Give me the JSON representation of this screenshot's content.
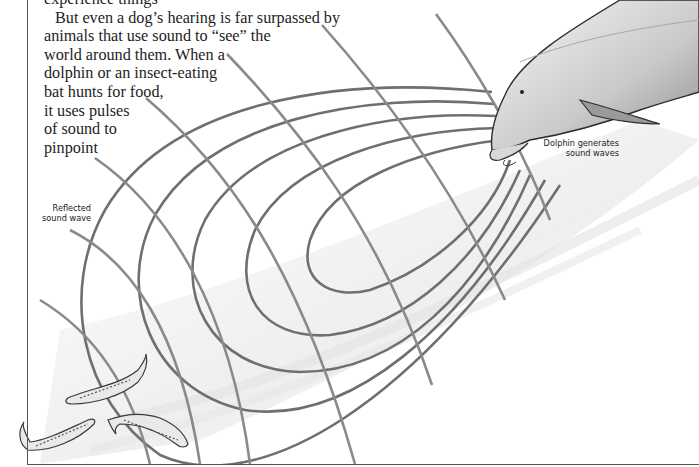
{
  "page": {
    "body_text": {
      "cut_off_line": "experience things",
      "lines": [
        "But even a dog’s hearing is far surpassed by",
        "animals that use sound to “see” the",
        "world around them. When a",
        "dolphin or an insect-eating",
        "bat hunts for food,",
        "it uses pulses",
        "of sound to",
        "pinpoint"
      ]
    },
    "illustration": {
      "subject": "dolphin echolocation",
      "wave_color": "#6f6f6f",
      "reflected_wave_color": "#8a8a8a",
      "captions": {
        "dolphin": [
          "Dolphin generates",
          "sound waves"
        ],
        "reflected": [
          "Reflected",
          "sound wave"
        ]
      },
      "fish_count": 3
    }
  }
}
